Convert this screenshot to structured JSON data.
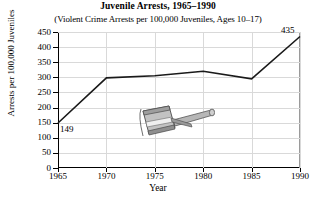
{
  "chart_data": {
    "type": "line",
    "title": "Juvenile Arrests, 1965–1990",
    "subtitle": "(Violent Crime Arrests per 100,000 Juveniles, Ages 10–17)",
    "xlabel": "Year",
    "ylabel": "Arrests per 100,000 Juveniles",
    "x": [
      1965,
      1970,
      1975,
      1980,
      1985,
      1990
    ],
    "values": [
      149,
      298,
      305,
      320,
      295,
      435
    ],
    "xtick_labels": [
      "1965",
      "1970",
      "1975",
      "1980",
      "1985",
      "1990"
    ],
    "ytick_labels": [
      "0",
      "50",
      "100",
      "150",
      "200",
      "250",
      "300",
      "350",
      "400",
      "450"
    ],
    "ytick_values": [
      0,
      50,
      100,
      150,
      200,
      250,
      300,
      350,
      400,
      450
    ],
    "ylim": [
      0,
      450
    ],
    "xlim": [
      1965,
      1990
    ],
    "grid": true,
    "legend": "none",
    "point_labels": [
      {
        "year": 1965,
        "text": "149"
      },
      {
        "year": 1990,
        "text": "435"
      }
    ],
    "annotations": [
      {
        "name": "gavel-illustration",
        "description": "grey judge's gavel graphic overlaying the plot area"
      }
    ],
    "line_color": "#1a1a1a",
    "grid_color": "#d9d9d9",
    "axis_color": "#000000"
  }
}
